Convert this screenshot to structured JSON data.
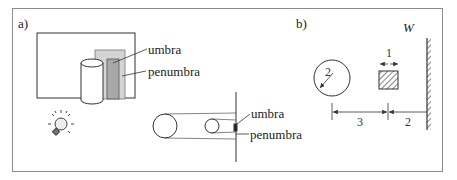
{
  "panel_a": {
    "label": "a)",
    "scene": {
      "umbra_label": "umbra",
      "penumbra_label": "penumbra",
      "umbra_color": "#a8a8a8",
      "penumbra_color": "#d4d4d4"
    },
    "eclipse": {
      "umbra_label": "umbra",
      "penumbra_label": "penumbra"
    },
    "icons": [
      "light-bulb-icon"
    ]
  },
  "panel_b": {
    "label": "b)",
    "wall_label": "W",
    "circle_radius_label": "2",
    "square_width_label": "1",
    "distance_circle_to_square": "3",
    "distance_square_to_wall": "2"
  }
}
